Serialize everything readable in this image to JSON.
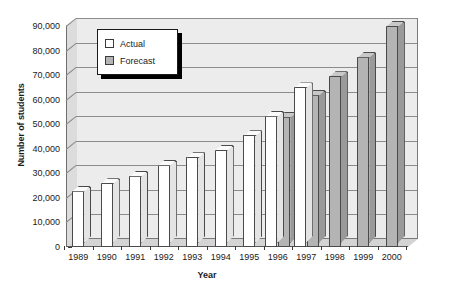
{
  "chart_data": {
    "type": "bar",
    "title": "",
    "xlabel": "Year",
    "ylabel": "Number of students",
    "categories": [
      "1989",
      "1990",
      "1991",
      "1992",
      "1993",
      "1994",
      "1995",
      "1996",
      "1997",
      "1998",
      "1999",
      "2000"
    ],
    "ylim": [
      0,
      90000
    ],
    "ytick_labels": [
      "0",
      "10,000",
      "20,000",
      "30,000",
      "40,000",
      "50,000",
      "60,000",
      "70,000",
      "80,000",
      "90,000"
    ],
    "ytick_values": [
      0,
      10000,
      20000,
      30000,
      40000,
      50000,
      60000,
      70000,
      80000,
      90000
    ],
    "grid": true,
    "legend_position": "upper-left-inside",
    "series": [
      {
        "name": "Actual",
        "color": "#ffffff",
        "values": [
          23000,
          26000,
          29000,
          33500,
          36500,
          39500,
          45500,
          53500,
          65000,
          null,
          null,
          null
        ]
      },
      {
        "name": "Forecast",
        "color": "#b4b4b4",
        "values": [
          null,
          null,
          null,
          null,
          null,
          null,
          null,
          53000,
          62000,
          69500,
          77500,
          90000
        ]
      }
    ]
  },
  "axes": {
    "y_title": "Number of students",
    "x_title": "Year"
  },
  "legend": {
    "items": [
      {
        "label": "Actual",
        "swatch": "actual"
      },
      {
        "label": "Forecast",
        "swatch": "forecast"
      }
    ]
  }
}
